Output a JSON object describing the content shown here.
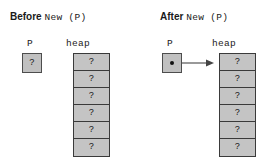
{
  "figure": {
    "background_color": "#ffffff",
    "box_fill_color": "#c4c4c4",
    "box_border_color": "#3a3a3a",
    "pointer_dot_color": "#111111",
    "arrow_color": "#555555"
  },
  "panels": [
    {
      "id": "before",
      "title_word": "Before",
      "title_code": "New (P)",
      "variable": {
        "label": "P",
        "value": "?",
        "has_pointer": false
      },
      "heap": {
        "label": "heap",
        "cells": [
          "?",
          "?",
          "?",
          "?",
          "?",
          "?"
        ]
      },
      "arrow": false
    },
    {
      "id": "after",
      "title_word": "After",
      "title_code": "New (P)",
      "variable": {
        "label": "P",
        "value": "",
        "has_pointer": true
      },
      "heap": {
        "label": "heap",
        "cells": [
          "?",
          "?",
          "?",
          "?",
          "?",
          "?"
        ]
      },
      "arrow": true
    }
  ]
}
